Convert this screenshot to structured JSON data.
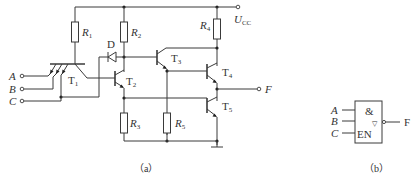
{
  "circuit_a": {
    "caption": "（a）",
    "supply": {
      "symbol": "U",
      "subscript": "CC"
    },
    "inputs": [
      {
        "label": "A"
      },
      {
        "label": "B"
      },
      {
        "label": "C"
      }
    ],
    "output": {
      "label": "F"
    },
    "resistors": [
      {
        "symbol": "R",
        "subscript": "1"
      },
      {
        "symbol": "R",
        "subscript": "2"
      },
      {
        "symbol": "R",
        "subscript": "3"
      },
      {
        "symbol": "R",
        "subscript": "4"
      },
      {
        "symbol": "R",
        "subscript": "5"
      }
    ],
    "transistors": [
      {
        "symbol": "T",
        "subscript": "1"
      },
      {
        "symbol": "T",
        "subscript": "2"
      },
      {
        "symbol": "T",
        "subscript": "3"
      },
      {
        "symbol": "T",
        "subscript": "4"
      },
      {
        "symbol": "T",
        "subscript": "5"
      }
    ],
    "diode": {
      "label": "D"
    }
  },
  "symbol_b": {
    "caption": "（b）",
    "inputs": [
      {
        "label": "A"
      },
      {
        "label": "B"
      },
      {
        "label": "C"
      }
    ],
    "function_label": "&",
    "tristate_mark": "▽",
    "enable_label": "EN",
    "output": {
      "label": "F"
    }
  }
}
